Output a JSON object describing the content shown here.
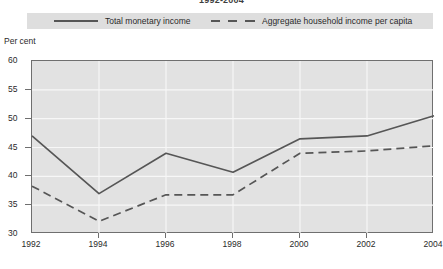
{
  "chart_data": {
    "type": "line",
    "title": "1992-2004",
    "xlabel": "",
    "ylabel": "Per cent",
    "ylim": [
      30,
      60
    ],
    "ytick_labels": [
      "60",
      "55",
      "50",
      "45",
      "40",
      "35",
      "30"
    ],
    "ytick_values": [
      60,
      55,
      50,
      45,
      40,
      35,
      30
    ],
    "grid": true,
    "legend_position": "top",
    "categories": [
      "1992",
      "1994",
      "1996",
      "1998",
      "2000",
      "2002",
      "2004"
    ],
    "x": [
      1992,
      1994,
      1996,
      1998,
      2000,
      2002,
      2004
    ],
    "series": [
      {
        "name": "Total monetary income",
        "style": "solid",
        "color": "#565656",
        "values": [
          47.0,
          37.0,
          44.0,
          40.7,
          46.5,
          47.0,
          50.5
        ]
      },
      {
        "name": "Aggregate household income per capita",
        "style": "dashed",
        "color": "#565656",
        "values": [
          38.3,
          32.2,
          36.8,
          36.8,
          44.0,
          44.4,
          45.3
        ]
      }
    ]
  },
  "legend": {
    "entries": [
      {
        "label": "Total monetary income",
        "style": "solid"
      },
      {
        "label": "Aggregate household income per capita",
        "style": "dashed"
      }
    ]
  },
  "colors": {
    "plot_background": "#e2e2e2",
    "legend_background": "#dedede",
    "gridline": "#f7f7f7",
    "axis": "#6f6f6f",
    "series": "#565656",
    "text": "#2a2a2a"
  }
}
